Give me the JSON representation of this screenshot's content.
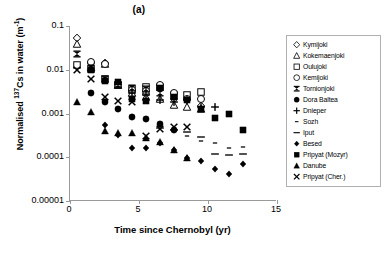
{
  "chart_data": {
    "type": "scatter",
    "title": "(a)",
    "xlabel": "Time since Chernobyl (yr)",
    "ylabel_parts": {
      "pre": "Normalised ",
      "sup1": "137",
      "mid": "Cs in water (m",
      "sup2": "-1",
      "post": ")"
    },
    "ylabel_plain": "Normalised 137Cs in water (m-1)",
    "xlim": [
      0,
      15
    ],
    "ylim": [
      1e-05,
      0.1
    ],
    "yscale": "log",
    "grid": false,
    "legend_position": "right-outside",
    "xticks": [
      0,
      5,
      10,
      15
    ],
    "xtick_labels": [
      "0",
      "5",
      "10",
      "15"
    ],
    "yticks": [
      0.1,
      0.01,
      0.001,
      0.0001,
      1e-05
    ],
    "ytick_labels": [
      "0.1",
      "0.01",
      "0.001",
      "0.0001",
      "0.00001"
    ],
    "series": [
      {
        "name": "Kymijoki",
        "marker": "open-diamond",
        "points": [
          [
            0.5,
            0.052
          ],
          [
            1.5,
            0.0145
          ],
          [
            2.5,
            0.0143
          ],
          [
            3.5,
            0.005
          ],
          [
            4.5,
            0.0032
          ],
          [
            5.5,
            0.0028
          ],
          [
            6.5,
            0.0038
          ],
          [
            7.5,
            0.0022
          ],
          [
            8.5,
            0.0021
          ],
          [
            9.5,
            0.0015
          ]
        ]
      },
      {
        "name": "Kokemaenjoki",
        "marker": "open-triangle",
        "points": [
          [
            0.5,
            0.038
          ],
          [
            1.5,
            0.0115
          ],
          [
            2.5,
            0.0136
          ],
          [
            3.5,
            0.0046
          ],
          [
            4.5,
            0.0029
          ],
          [
            5.5,
            0.0024
          ],
          [
            6.5,
            0.0021
          ],
          [
            7.5,
            0.0016
          ],
          [
            8.5,
            0.0014
          ],
          [
            9.5,
            0.0013
          ]
        ]
      },
      {
        "name": "Oulujoki",
        "marker": "open-square",
        "points": [
          [
            0.5,
            0.013
          ],
          [
            1.5,
            0.0105
          ],
          [
            2.5,
            0.0062
          ],
          [
            3.5,
            0.0045
          ],
          [
            4.5,
            0.0037
          ],
          [
            5.5,
            0.0041
          ],
          [
            6.5,
            0.004
          ],
          [
            7.5,
            0.0027
          ],
          [
            8.5,
            0.0027
          ],
          [
            9.5,
            0.0031
          ]
        ]
      },
      {
        "name": "Kemijoki",
        "marker": "open-circle",
        "points": [
          [
            1.5,
            0.015
          ],
          [
            2.5,
            0.0135
          ],
          [
            3.5,
            0.0048
          ],
          [
            4.5,
            0.0035
          ],
          [
            5.5,
            0.0033
          ],
          [
            6.5,
            0.0046
          ],
          [
            7.5,
            0.003
          ],
          [
            8.5,
            0.0022
          ],
          [
            9.5,
            0.0021
          ]
        ]
      },
      {
        "name": "Tornionjoki",
        "marker": "star",
        "points": [
          [
            0.5,
            0.0225
          ],
          [
            1.5,
            0.0108
          ],
          [
            2.5,
            0.006
          ],
          [
            3.5,
            0.0044
          ],
          [
            4.5,
            0.0038
          ],
          [
            5.5,
            0.0036
          ],
          [
            6.5,
            0.003
          ]
        ]
      },
      {
        "name": "Dora Baltea",
        "marker": "filled-circle",
        "points": [
          [
            1.5,
            0.0029
          ],
          [
            2.5,
            0.0018
          ],
          [
            3.5,
            0.0013
          ],
          [
            4.5,
            0.00082
          ],
          [
            5.5,
            0.00076
          ],
          [
            6.5,
            0.00058
          ],
          [
            7.5,
            0.00042
          ]
        ]
      },
      {
        "name": "Dnieper",
        "marker": "plus",
        "points": [
          [
            4.5,
            0.0029
          ],
          [
            5.5,
            0.0027
          ],
          [
            6.5,
            0.002
          ],
          [
            7.5,
            0.0018
          ],
          [
            8.5,
            0.002
          ],
          [
            9.5,
            0.0014
          ],
          [
            10.5,
            0.0014
          ]
        ]
      },
      {
        "name": "Sozh",
        "marker": "dash-small",
        "points": [
          [
            7.5,
            0.00039
          ],
          [
            8.5,
            0.0003
          ],
          [
            9.5,
            0.00023
          ],
          [
            10.5,
            0.00021
          ],
          [
            11.5,
            0.00016
          ],
          [
            12.5,
            0.00017
          ]
        ]
      },
      {
        "name": "Iput",
        "marker": "dash-long",
        "points": [
          [
            6.5,
            0.00047
          ],
          [
            7.5,
            0.00043
          ],
          [
            8.5,
            0.00037
          ],
          [
            9.5,
            0.00029
          ],
          [
            10.5,
            0.00012
          ],
          [
            11.5,
            0.00011
          ],
          [
            12.5,
            0.00012
          ]
        ]
      },
      {
        "name": "Besed",
        "marker": "filled-diamond",
        "points": [
          [
            2.5,
            0.00055
          ],
          [
            3.5,
            0.00033
          ],
          [
            4.5,
            0.00016
          ],
          [
            5.5,
            0.00016
          ],
          [
            6.5,
            0.00021
          ],
          [
            7.5,
            0.00015
          ],
          [
            8.5,
            9.5e-05
          ],
          [
            9.5,
            8.1e-05
          ],
          [
            10.5,
            5.4e-05
          ],
          [
            11.5,
            4.1e-05
          ],
          [
            12.5,
            7e-05
          ]
        ]
      },
      {
        "name": "Pripyat (Mozyr)",
        "marker": "filled-square",
        "points": [
          [
            1.5,
            0.01
          ],
          [
            2.5,
            0.0055
          ],
          [
            3.5,
            0.0052
          ],
          [
            4.5,
            0.0021
          ],
          [
            5.5,
            0.0019
          ],
          [
            6.5,
            0.0038
          ],
          [
            7.5,
            0.0024
          ],
          [
            8.5,
            0.002
          ],
          [
            9.5,
            0.0013
          ],
          [
            10.5,
            0.0008
          ],
          [
            11.5,
            0.00095
          ],
          [
            12.5,
            0.00042
          ]
        ]
      },
      {
        "name": "Danube",
        "marker": "filled-triangle",
        "points": [
          [
            0.5,
            0.0018
          ],
          [
            1.5,
            0.0011
          ],
          [
            2.5,
            0.0004
          ],
          [
            3.5,
            0.00035
          ],
          [
            4.5,
            0.00036
          ],
          [
            5.5,
            0.00028
          ],
          [
            6.5,
            0.00022
          ],
          [
            7.5,
            0.00015
          ],
          [
            8.5,
            9.6e-05
          ]
        ]
      },
      {
        "name": "Pripyat (Cher.)",
        "marker": "cross-x",
        "points": [
          [
            0.5,
            0.0101
          ],
          [
            1.5,
            0.006
          ],
          [
            2.5,
            0.0024
          ],
          [
            3.5,
            0.0019
          ],
          [
            4.5,
            0.0018
          ],
          [
            5.5,
            0.0003
          ],
          [
            6.5,
            0.00045
          ],
          [
            7.5,
            0.0005
          ],
          [
            8.5,
            0.00048
          ]
        ]
      }
    ]
  },
  "legend": {
    "items": [
      {
        "label": "Kymijoki",
        "marker": "open-diamond"
      },
      {
        "label": "Kokemaenjoki",
        "marker": "open-triangle"
      },
      {
        "label": "Oulujoki",
        "marker": "open-square"
      },
      {
        "label": "Kemijoki",
        "marker": "open-circle"
      },
      {
        "label": "Tornionjoki",
        "marker": "star"
      },
      {
        "label": "Dora Baltea",
        "marker": "filled-circle"
      },
      {
        "label": "Dnieper",
        "marker": "plus"
      },
      {
        "label": "Sozh",
        "marker": "dash-small"
      },
      {
        "label": "Iput",
        "marker": "dash-long"
      },
      {
        "label": "Besed",
        "marker": "filled-diamond"
      },
      {
        "label": "Pripyat (Mozyr)",
        "marker": "filled-square"
      },
      {
        "label": "Danube",
        "marker": "filled-triangle"
      },
      {
        "label": "Pripyat (Cher.)",
        "marker": "cross-x"
      }
    ]
  },
  "colors": {
    "ink": "#000000",
    "axis": "#9a9a9a",
    "legend_border": "#b0b0b0"
  }
}
